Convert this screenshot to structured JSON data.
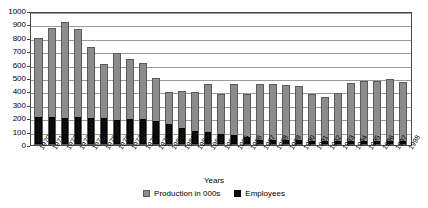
{
  "chart_data": {
    "type": "bar",
    "title": "",
    "subtitle": "",
    "xlabel": "Years",
    "ylabel": "",
    "ylim": [
      0,
      1000
    ],
    "ytick_step": 100,
    "yticks": [
      0,
      100,
      200,
      300,
      400,
      500,
      600,
      700,
      800,
      900,
      1000
    ],
    "grid": true,
    "grid_axis": "y",
    "legend_position": "bottom-center",
    "bar_style": "overlaid",
    "categories": [
      "1970",
      "1971",
      "1972",
      "1973",
      "1974",
      "1975",
      "1976",
      "1977",
      "1978",
      "1979",
      "1980",
      "1981",
      "1982",
      "1983",
      "1984",
      "1985",
      "1986",
      "1987",
      "1988",
      "1989",
      "1990",
      "1991",
      "1992",
      "1993",
      "1994",
      "1995",
      "1996",
      "1997",
      "1998"
    ],
    "series": [
      {
        "name": "Production in 000s",
        "color": "#8c8c8c",
        "values": [
          795,
          870,
          915,
          868,
          735,
          605,
          690,
          645,
          610,
          498,
          393,
          405,
          395,
          455,
          378,
          455,
          380,
          455,
          455,
          445,
          443,
          378,
          360,
          385,
          460,
          475,
          480,
          490,
          470
        ]
      },
      {
        "name": "Employees",
        "color": "#0d0d0d",
        "values": [
          198,
          198,
          192,
          198,
          196,
          193,
          182,
          190,
          185,
          175,
          147,
          118,
          95,
          88,
          78,
          70,
          53,
          30,
          28,
          28,
          28,
          26,
          25,
          25,
          25,
          24,
          24,
          24,
          24
        ]
      }
    ]
  },
  "legend": {
    "entries": [
      {
        "label": "Production in 000s",
        "swatch": "production"
      },
      {
        "label": "Employees",
        "swatch": "employees"
      }
    ]
  },
  "colors": {
    "production": "#8c8c8c",
    "employees": "#0d0d0d",
    "grid": "#9a9a9a",
    "axis": "#4a4a4a",
    "background": "#ffffff"
  }
}
